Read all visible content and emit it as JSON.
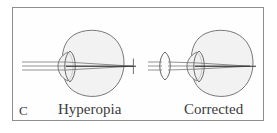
{
  "figure": {
    "panel_letter": "C",
    "left_label": "Hyperopia",
    "right_label": "Corrected",
    "border_color": "#8e8e8e",
    "background_color": "#ffffff",
    "ink_color": "#555555",
    "eye_fill_color": "#f2f2f2",
    "ray_color": "#6b6b6b",
    "axis_color": "#2b2b2b",
    "text_color": "#3b3b3b"
  },
  "diagram_left": {
    "name": "hyperopia-eye-diagram",
    "eye_label": "eyeball",
    "cornea_label": "cornea",
    "lens_label": "crystalline-lens",
    "rays_label": "incoming-parallel-light-rays",
    "focal_label": "focal-point-behind-retina",
    "ray_count": 3,
    "corrective_lens": false
  },
  "diagram_right": {
    "name": "corrected-eye-diagram",
    "eye_label": "eyeball",
    "cornea_label": "cornea",
    "lens_label": "crystalline-lens",
    "rays_label": "incoming-parallel-light-rays",
    "focal_label": "focal-point-on-retina",
    "ray_count": 3,
    "corrective_lens": true,
    "corrective_lens_label": "converging-corrective-lens"
  }
}
